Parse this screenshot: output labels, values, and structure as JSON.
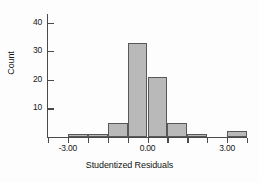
{
  "chart_data": {
    "type": "bar",
    "title": "",
    "subtitle": "",
    "xlabel": "Studentized Residuals",
    "ylabel": "Count",
    "grid": false,
    "legend": "none",
    "xlim": [
      -3.75,
      3.75
    ],
    "ylim": [
      0,
      43
    ],
    "bin_width": 0.75,
    "xticks": [
      -3.0,
      0.0,
      3.0
    ],
    "xtick_labels": [
      "-3.00",
      "0.00",
      "3.00"
    ],
    "yticks": [
      10,
      20,
      30,
      40
    ],
    "ytick_labels": [
      "10",
      "20",
      "30",
      "40"
    ],
    "bin_left_edges": [
      -3.0,
      -2.25,
      -1.5,
      -0.75,
      0.0,
      0.75,
      1.5,
      2.25,
      3.0
    ],
    "categories": [
      "-3.00",
      "-2.25",
      "-1.50",
      "-0.75",
      "0.00",
      "0.75",
      "1.50",
      "2.25",
      "3.00"
    ],
    "values": [
      1,
      1,
      5,
      33,
      21,
      5,
      1,
      0,
      2
    ],
    "bar_color": "#b9b9b9",
    "bar_edge_color": "#585858",
    "axis_color": "#4a4a4a",
    "background": "#fdfdfd"
  },
  "axes": {
    "y_title": "Count",
    "x_title": "Studentized Residuals"
  }
}
